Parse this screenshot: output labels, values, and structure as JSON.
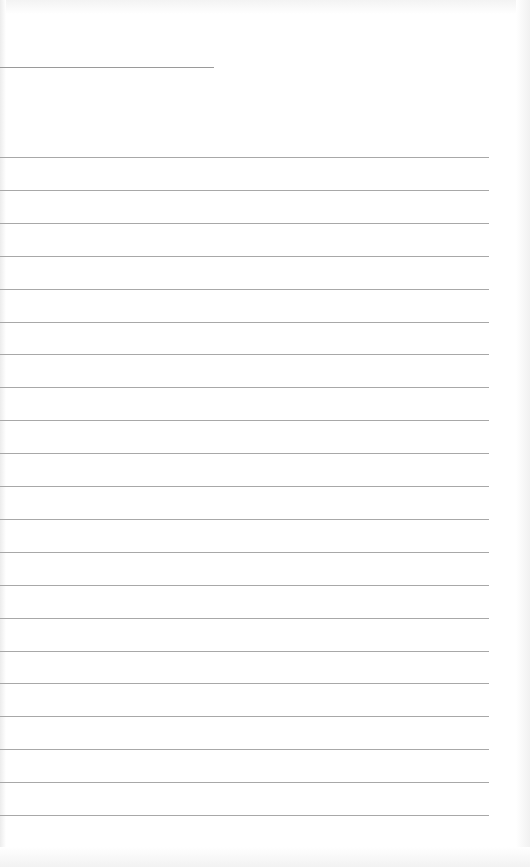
{
  "page": {
    "type": "lined-paper",
    "background": "#ffffff",
    "line_color": "#a8a8a8",
    "header_line": {
      "top": 67,
      "width": 214
    },
    "ruled_lines": {
      "count": 21,
      "first_top": 157,
      "spacing": 32.9,
      "width": 489
    }
  }
}
